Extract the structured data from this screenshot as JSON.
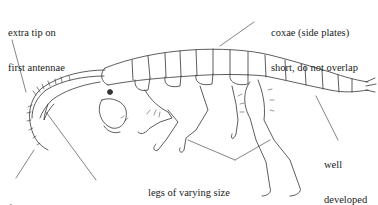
{
  "diagram": {
    "labels": {
      "extra_tip": [
        "extra tip on",
        "first antennae"
      ],
      "first_antennae": [
        "first antennae",
        "longer than second"
      ],
      "coxae": [
        "coxae (side plates)",
        "short, do not overlap"
      ],
      "legs": [
        "legs of varying size",
        "and shape, some with",
        "subchelate claws"
      ],
      "abdomen": [
        "well",
        "developed",
        "abdomen"
      ]
    }
  }
}
